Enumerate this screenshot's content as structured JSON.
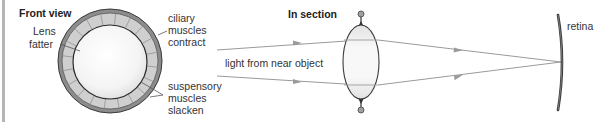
{
  "front_view": {
    "title": "Front view",
    "lens_label": [
      "Lens",
      "fatter"
    ],
    "ciliary_label": [
      "ciliary",
      "muscles",
      "contract"
    ],
    "suspensory_label": [
      "suspensory",
      "muscles",
      "slacken"
    ]
  },
  "section_view": {
    "title": "In section",
    "light_label": "light from near object",
    "retina_label": "retina"
  },
  "colors": {
    "outer_ring": "#8c8c8c",
    "segment_band": "#cfcfcf",
    "outline": "#3a3a3a",
    "ray": "#9a9a9a",
    "left_border": "#b5b5b5"
  }
}
